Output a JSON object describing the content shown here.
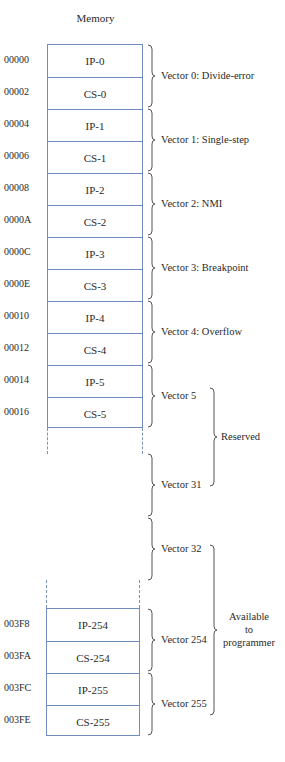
{
  "title": "Memory",
  "top_block": {
    "rows": [
      {
        "addr": "00000",
        "cell": "IP-0"
      },
      {
        "addr": "00002",
        "cell": "CS-0"
      },
      {
        "addr": "00004",
        "cell": "IP-1"
      },
      {
        "addr": "00006",
        "cell": "CS-1"
      },
      {
        "addr": "00008",
        "cell": "IP-2"
      },
      {
        "addr": "0000A",
        "cell": "CS-2"
      },
      {
        "addr": "0000C",
        "cell": "IP-3"
      },
      {
        "addr": "0000E",
        "cell": "CS-3"
      },
      {
        "addr": "00010",
        "cell": "IP-4"
      },
      {
        "addr": "00012",
        "cell": "CS-4"
      },
      {
        "addr": "00014",
        "cell": "IP-5"
      },
      {
        "addr": "00016",
        "cell": "CS-5"
      }
    ]
  },
  "bottom_block": {
    "rows": [
      {
        "addr": "003F8",
        "cell": "IP-254"
      },
      {
        "addr": "003FA",
        "cell": "CS-254"
      },
      {
        "addr": "003FC",
        "cell": "IP-255"
      },
      {
        "addr": "003FE",
        "cell": "CS-255"
      }
    ]
  },
  "vectors": [
    "Vector 0: Divide-error",
    "Vector 1: Single-step",
    "Vector 2: NMI",
    "Vector 3: Breakpoint",
    "Vector 4: Overflow",
    "Vector 5",
    "Vector 31",
    "Vector 32",
    "Vector 254",
    "Vector 255"
  ],
  "groups": {
    "reserved": "Reserved",
    "available": [
      "Available",
      "to",
      "programmer"
    ]
  },
  "colors": {
    "box_border": "#6e8cbc",
    "brace": "#555555",
    "text": "#2a2a2a"
  }
}
